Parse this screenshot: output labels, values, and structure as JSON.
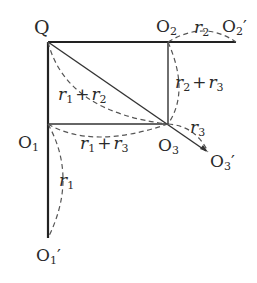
{
  "diagram": {
    "type": "geometry",
    "points": {
      "Q": {
        "label": "Q",
        "x": 48,
        "y": 42
      },
      "O2": {
        "label": "O",
        "sub": "2",
        "x": 168,
        "y": 42
      },
      "O2p": {
        "label": "O",
        "sub": "2",
        "prime": "′",
        "x": 236,
        "y": 42
      },
      "O1": {
        "label": "O",
        "sub": "1",
        "x": 48,
        "y": 124
      },
      "O3": {
        "label": "O",
        "sub": "3",
        "x": 168,
        "y": 124
      },
      "O3p": {
        "label": "O",
        "sub": "3",
        "prime": "′",
        "x": 208,
        "y": 152
      },
      "O1p": {
        "label": "O",
        "sub": "1",
        "prime": "′",
        "x": 48,
        "y": 238
      }
    },
    "segment_labels": {
      "r1_plus_r2": {
        "a": "r",
        "as": "1",
        "op": "+",
        "b": "r",
        "bs": "2"
      },
      "r2_plus_r3": {
        "a": "r",
        "as": "2",
        "op": "+",
        "b": "r",
        "bs": "3"
      },
      "r1_plus_r3": {
        "a": "r",
        "as": "1",
        "op": "+",
        "b": "r",
        "bs": "3"
      },
      "r2": {
        "a": "r",
        "as": "2"
      },
      "r3": {
        "a": "r",
        "as": "3"
      },
      "r1": {
        "a": "r",
        "as": "1"
      }
    },
    "colors": {
      "solid": "#222222",
      "dashed": "#555555",
      "text": "#2a2a2a"
    }
  }
}
